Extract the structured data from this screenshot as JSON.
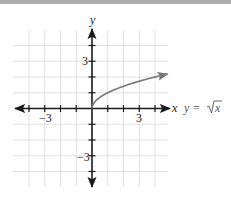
{
  "chart_data": {
    "type": "line",
    "title": "",
    "xlabel": "x",
    "ylabel": "y",
    "xlim": [
      -5,
      5
    ],
    "ylim": [
      -5,
      5
    ],
    "grid": true,
    "grid_range": {
      "x": [
        -4,
        4
      ],
      "y": [
        -4,
        4
      ]
    },
    "x_ticks": [
      -4,
      -3,
      -2,
      -1,
      1,
      2,
      3,
      4
    ],
    "y_ticks": [
      -4,
      -3,
      -2,
      -1,
      1,
      2,
      3,
      4
    ],
    "x_tick_labels": [
      {
        "value": -3,
        "label": "−3"
      },
      {
        "value": 3,
        "label": "3"
      }
    ],
    "y_tick_labels": [
      {
        "value": 3,
        "label": "3"
      },
      {
        "value": -3,
        "label": "−3"
      }
    ],
    "series": [
      {
        "name": "y = √x",
        "function": "sqrt(x)",
        "x": [
          0,
          0.25,
          1,
          2,
          3,
          4,
          4.8
        ],
        "values": [
          0,
          0.5,
          1,
          1.41,
          1.73,
          2,
          2.19
        ],
        "color": "#777777",
        "end_arrow": true
      }
    ],
    "annotations": [
      {
        "text": "y = √x",
        "position": "right of x-axis"
      }
    ]
  },
  "labels": {
    "x_axis": "x",
    "y_axis": "y",
    "equation_prefix": "y = ",
    "equation_radicand": "x",
    "tick_neg3_x": "−3",
    "tick_pos3_x": "3",
    "tick_pos3_y": "3",
    "tick_neg3_y": "−3"
  },
  "colors": {
    "axis": "#1a1a1a",
    "grid": "#d9d9d9",
    "curve": "#777777",
    "top_band": "#acacac"
  }
}
